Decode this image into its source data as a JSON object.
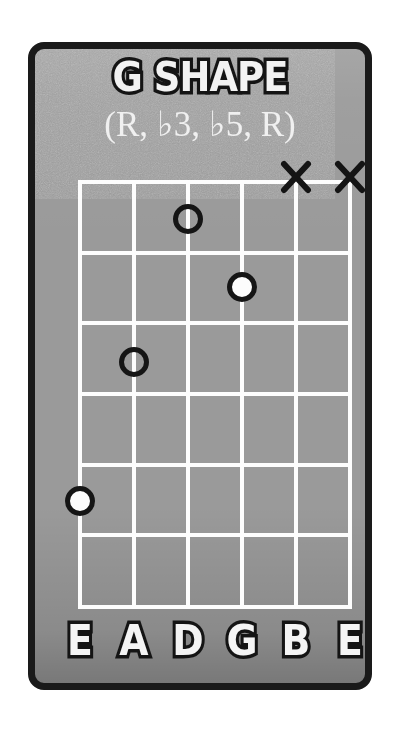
{
  "card": {
    "title": "G SHAPE",
    "subtitle": "(R, ♭3, ♭5, R)",
    "background_color": "#9a9a9a",
    "border_color": "#1a1a1a",
    "line_color": "#fdfdfd",
    "text_color": "#f2f2f2",
    "outline_color": "#141414"
  },
  "diagram": {
    "type": "guitar-chord-diagram",
    "strings": 6,
    "frets": 6,
    "string_labels": [
      "E",
      "A",
      "D",
      "G",
      "B",
      "E"
    ],
    "string_x": [
      0,
      54,
      108,
      162,
      216,
      270
    ],
    "fret_y": [
      0,
      71,
      141,
      212,
      283,
      353,
      425
    ],
    "dots": [
      {
        "name": "dot-d-string-fret-1",
        "string_index": 2,
        "fret": 1,
        "style": "open",
        "x": 108,
        "y": 37
      },
      {
        "name": "dot-g-string-fret-2",
        "string_index": 3,
        "fret": 2,
        "style": "filled",
        "x": 162,
        "y": 105
      },
      {
        "name": "dot-a-string-fret-3",
        "string_index": 1,
        "fret": 3,
        "style": "open",
        "x": 54,
        "y": 180
      },
      {
        "name": "dot-low-e-fret-5",
        "string_index": 0,
        "fret": 5,
        "style": "filled",
        "x": 0,
        "y": 319
      }
    ],
    "muted": [
      {
        "name": "x-mark-b-string",
        "string_index": 4,
        "x": 216,
        "y": -5
      },
      {
        "name": "x-mark-high-e-string",
        "string_index": 5,
        "x": 270,
        "y": -5
      }
    ]
  }
}
